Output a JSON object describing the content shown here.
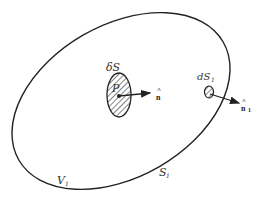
{
  "diagram": {
    "type": "surface-volume illustration",
    "outer_region": {
      "volume_label": "V",
      "volume_subscript": "1",
      "surface_label": "S",
      "surface_subscript": "1"
    },
    "inner_element": {
      "label": "δS",
      "point_label": "P",
      "normal_label": "n",
      "normal_hat": "^"
    },
    "boundary_element": {
      "label": "dS",
      "subscript": "1",
      "normal_label": "n",
      "normal_subscript": "1",
      "normal_hat": "^"
    },
    "colors": {
      "stroke": "#222222",
      "background": "#ffffff"
    }
  }
}
